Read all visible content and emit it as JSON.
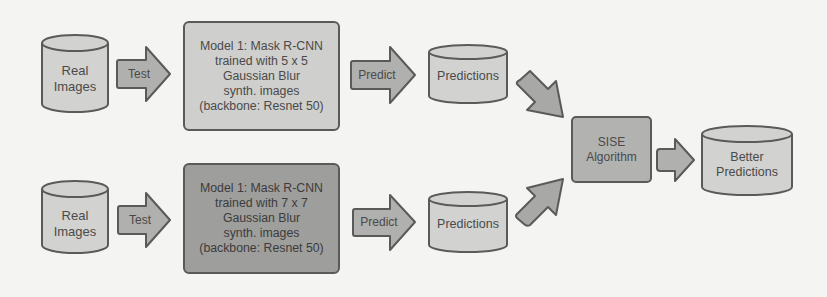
{
  "diagram": {
    "colors": {
      "background": "#f4f4f2",
      "light_fill": "#d2d2d0",
      "mid_fill": "#b4b4b2",
      "dark_fill": "#9c9c9a",
      "stroke": "#5a5a5a",
      "text": "#4a4a4a"
    },
    "top_row": {
      "input": {
        "line1": "Real",
        "line2": "Images"
      },
      "test_arrow": "Test",
      "model": {
        "lines": [
          "Model 1: Mask R-CNN",
          "trained with 5 x 5",
          "Gaussian Blur",
          "synth. images",
          "(backbone: Resnet 50)"
        ]
      },
      "predict_arrow": "Predict",
      "output": "Predictions"
    },
    "bottom_row": {
      "input": {
        "line1": "Real",
        "line2": "Images"
      },
      "test_arrow": "Test",
      "model": {
        "lines": [
          "Model 1: Mask R-CNN",
          "trained with 7 x 7",
          "Gaussian Blur",
          "synth. images",
          "(backbone: Resnet 50)"
        ]
      },
      "predict_arrow": "Predict",
      "output": "Predictions"
    },
    "merge": {
      "algorithm": {
        "line1": "SISE",
        "line2": "Algorithm"
      },
      "result": {
        "line1": "Better",
        "line2": "Predictions"
      }
    }
  }
}
